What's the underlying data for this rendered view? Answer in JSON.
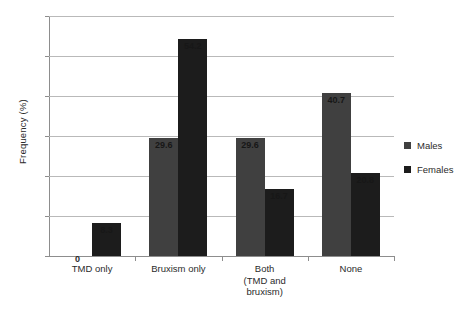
{
  "chart_data": {
    "type": "bar",
    "title": "",
    "xlabel": "",
    "ylabel": "Frequency (%)",
    "ylim": [
      0,
      60
    ],
    "ytick_step": 10,
    "yticks": [
      "60",
      "50",
      "40",
      "30",
      "20",
      "10",
      "0"
    ],
    "grid": true,
    "legend_position": "right",
    "categories": [
      "TMD only",
      "Bruxism only",
      "Both\n(TMD and\nbruxism)",
      "None"
    ],
    "category_lines": [
      [
        "TMD only"
      ],
      [
        "Bruxism only"
      ],
      [
        "Both",
        "(TMD and",
        "bruxism)"
      ],
      [
        "None"
      ]
    ],
    "series": [
      {
        "name": "Males",
        "color": "#404040",
        "values": [
          0,
          29.6,
          29.6,
          40.7
        ],
        "labels": [
          "0",
          "29.6",
          "29.6",
          "40.7"
        ]
      },
      {
        "name": "Females",
        "color": "#1c1c1c",
        "values": [
          8.3,
          54.2,
          16.7,
          20.8
        ],
        "labels": [
          "8.3",
          "54.2",
          "16.7",
          "20.8"
        ]
      }
    ]
  },
  "axis": {
    "y_title": "Frequency (%)",
    "ticks": [
      {
        "label": "60"
      },
      {
        "label": "50"
      },
      {
        "label": "40"
      },
      {
        "label": "30"
      },
      {
        "label": "20"
      },
      {
        "label": "10"
      },
      {
        "label": "0"
      }
    ]
  },
  "legend": {
    "items": [
      {
        "label": "Males",
        "color": "#404040"
      },
      {
        "label": "Females",
        "color": "#1c1c1c"
      }
    ]
  },
  "colors": {
    "males": "#404040",
    "females": "#1c1c1c",
    "gridline": "#b9b9b9",
    "axis": "#8d8d8d",
    "text": "#2b2b2b",
    "background": "#ffffff"
  }
}
